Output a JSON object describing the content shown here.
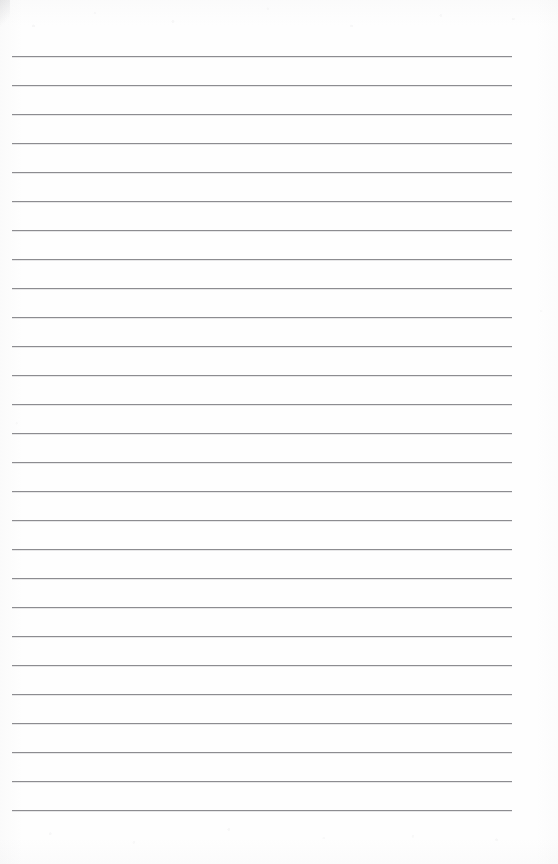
{
  "document": {
    "type": "lined-notebook-page",
    "title": "",
    "content_text": "",
    "is_blank": true,
    "page_width": 558,
    "page_height": 864,
    "background_color": "#fefefe"
  },
  "ruling": {
    "line_color": "#8c8c90",
    "line_thickness_px": 1,
    "line_count": 27,
    "first_line_y": 56,
    "line_spacing_px": 29,
    "line_start_x": 12,
    "line_end_x": 512,
    "line_length_px": 500,
    "top_margin_px": 56,
    "bottom_margin_px": 46,
    "left_margin_px": 12,
    "right_margin_px": 46,
    "has_vertical_margin_rule": false,
    "lines_y": [
      56,
      85,
      114,
      143,
      172,
      201,
      230,
      259,
      288,
      317,
      346,
      375,
      404,
      433,
      462,
      491,
      520,
      549,
      578,
      607,
      636,
      665,
      694,
      723,
      752,
      781,
      810
    ]
  },
  "annotations": {
    "handwriting": [],
    "marks": [],
    "corner_smudge_present": true
  }
}
